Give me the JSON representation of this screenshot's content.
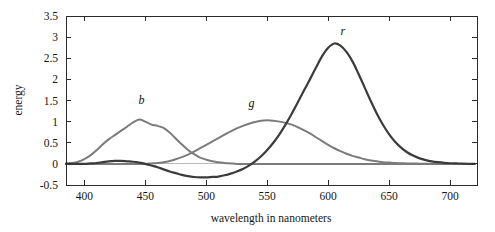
{
  "figure": {
    "background_color": "#ffffff",
    "frame_color": "#2b2b2b",
    "zero_line_color": "#b9b9b9"
  },
  "chart_data": {
    "type": "line",
    "title": "",
    "subtitle": "",
    "xlabel": "wavelength in nanometers",
    "ylabel": "energy",
    "xlim": [
      385,
      722
    ],
    "ylim": [
      -0.5,
      3.5
    ],
    "grid": false,
    "legend_position": "inline-curve-labels",
    "xticks": [
      400,
      450,
      500,
      550,
      600,
      650,
      700
    ],
    "xtick_labels": [
      "400",
      "450",
      "500",
      "550",
      "600",
      "650",
      "700"
    ],
    "yticks": [
      -0.5,
      0,
      0.5,
      1,
      1.5,
      2,
      2.5,
      3,
      3.5
    ],
    "ytick_labels": [
      "-0.5",
      "0",
      "0.5",
      "1",
      "1.5",
      "2",
      "2.5",
      "3",
      "3.5"
    ],
    "x": [
      385,
      390,
      395,
      400,
      405,
      410,
      415,
      420,
      425,
      430,
      435,
      440,
      445,
      450,
      455,
      460,
      465,
      470,
      475,
      480,
      485,
      490,
      495,
      500,
      505,
      510,
      515,
      520,
      525,
      530,
      535,
      540,
      545,
      550,
      555,
      560,
      565,
      570,
      575,
      580,
      585,
      590,
      595,
      600,
      605,
      610,
      615,
      620,
      625,
      630,
      635,
      640,
      645,
      650,
      655,
      660,
      665,
      670,
      675,
      680,
      685,
      690,
      695,
      700,
      705,
      710,
      715,
      720
    ],
    "series": [
      {
        "name": "b",
        "label": "b",
        "color": "#7b7b7b",
        "line_width": 2.0,
        "label_x": 447,
        "label_y": 1.42,
        "peak_x": 445,
        "peak_y": 1.05,
        "values": [
          0.01,
          0.02,
          0.05,
          0.11,
          0.2,
          0.32,
          0.46,
          0.58,
          0.68,
          0.78,
          0.88,
          0.98,
          1.05,
          1.0,
          0.93,
          0.9,
          0.85,
          0.74,
          0.6,
          0.46,
          0.33,
          0.23,
          0.15,
          0.1,
          0.06,
          0.04,
          0.02,
          0.01,
          0.0,
          0.0,
          0.0,
          0.0,
          0.0,
          0.0,
          0.0,
          0.0,
          0.0,
          0.0,
          0.0,
          0.0,
          0.0,
          0.0,
          0.0,
          0.0,
          0.0,
          0.0,
          0.0,
          0.0,
          0.0,
          0.0,
          0.0,
          0.0,
          0.0,
          0.0,
          0.0,
          0.0,
          0.0,
          0.0,
          0.0,
          0.0,
          0.0,
          0.0,
          0.0,
          0.0,
          0.0,
          0.0,
          0.0,
          0.0
        ]
      },
      {
        "name": "g",
        "label": "g",
        "color": "#7b7b7b",
        "line_width": 2.0,
        "label_x": 537,
        "label_y": 1.34,
        "peak_x": 545,
        "peak_y": 1.03,
        "values": [
          0.0,
          0.0,
          0.0,
          0.0,
          0.0,
          0.0,
          0.0,
          0.0,
          0.0,
          0.0,
          0.0,
          0.0,
          0.0,
          0.0,
          0.01,
          0.02,
          0.04,
          0.07,
          0.11,
          0.16,
          0.22,
          0.29,
          0.37,
          0.45,
          0.53,
          0.61,
          0.69,
          0.77,
          0.84,
          0.9,
          0.95,
          0.99,
          1.02,
          1.03,
          1.02,
          1.0,
          0.97,
          0.93,
          0.87,
          0.8,
          0.72,
          0.63,
          0.54,
          0.45,
          0.37,
          0.3,
          0.24,
          0.19,
          0.15,
          0.11,
          0.08,
          0.06,
          0.04,
          0.03,
          0.02,
          0.015,
          0.01,
          0.008,
          0.005,
          0.003,
          0.002,
          0.001,
          0.0,
          0.0,
          0.0,
          0.0,
          0.0,
          0.0
        ]
      },
      {
        "name": "r",
        "label": "r",
        "color": "#3b3b3b",
        "line_width": 2.2,
        "label_x": 612,
        "label_y": 3.06,
        "peak_x": 600,
        "peak_y": 2.85,
        "min_x": 500,
        "min_y": -0.32,
        "values": [
          0.0,
          0.0,
          0.0,
          0.0,
          0.01,
          0.02,
          0.04,
          0.06,
          0.07,
          0.07,
          0.06,
          0.05,
          0.03,
          0.0,
          -0.04,
          -0.08,
          -0.13,
          -0.18,
          -0.22,
          -0.26,
          -0.29,
          -0.31,
          -0.32,
          -0.32,
          -0.31,
          -0.3,
          -0.27,
          -0.23,
          -0.18,
          -0.12,
          -0.04,
          0.06,
          0.18,
          0.33,
          0.5,
          0.7,
          0.93,
          1.18,
          1.45,
          1.73,
          2.0,
          2.28,
          2.55,
          2.75,
          2.85,
          2.8,
          2.65,
          2.42,
          2.12,
          1.8,
          1.48,
          1.18,
          0.92,
          0.7,
          0.52,
          0.38,
          0.27,
          0.19,
          0.13,
          0.09,
          0.06,
          0.04,
          0.025,
          0.015,
          0.01,
          0.005,
          0.002,
          0.0
        ]
      }
    ]
  }
}
